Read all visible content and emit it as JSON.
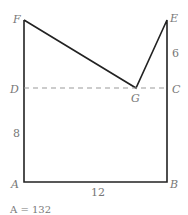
{
  "diagram": {
    "vertices": {
      "A": "A",
      "B": "B",
      "C": "C",
      "D": "D",
      "E": "E",
      "F": "F",
      "G": "G"
    },
    "measurements": {
      "AB": "12",
      "AD": "8",
      "CE": "6"
    },
    "area_label": "A = 132",
    "colors": {
      "line": "#222222",
      "dashed": "#999999",
      "label": "#777777"
    }
  }
}
